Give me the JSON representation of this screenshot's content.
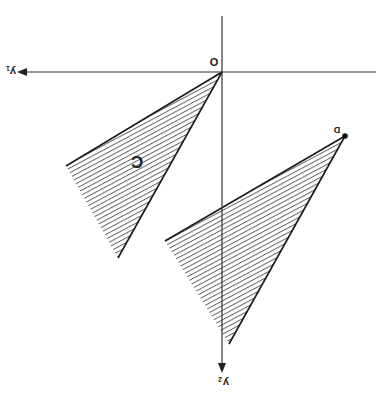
{
  "diagram": {
    "orientation": "rotated 180 degrees",
    "labels": {
      "origin": "O",
      "point_d": "D",
      "cone_c": "C",
      "axis_y1": "y1",
      "axis_y2": "y2"
    },
    "colors": {
      "line": "#1a1a1a",
      "hatch": "#555555",
      "background": "#ffffff"
    }
  }
}
